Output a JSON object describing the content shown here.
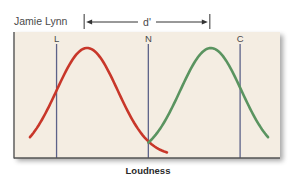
{
  "chart_data": {
    "type": "line",
    "title": "Jamie Lynn",
    "xlabel": "Loudness",
    "ylabel": "",
    "annotation": "d'",
    "xlim": [
      0,
      10
    ],
    "ylim": [
      0,
      1
    ],
    "grid": false,
    "series": [
      {
        "name": "noise",
        "color": "#c8372a",
        "mean": 2.75,
        "sd": 1.15,
        "x_range": [
          0.6,
          5.75
        ]
      },
      {
        "name": "signal",
        "color": "#5a9460",
        "mean": 7.4,
        "sd": 1.15,
        "x_range": [
          5.05,
          9.55
        ]
      }
    ],
    "criteria": [
      {
        "label": "L",
        "x": 1.6
      },
      {
        "label": "N",
        "x": 5.05
      },
      {
        "label": "C",
        "x": 8.5
      }
    ],
    "dprime": {
      "from": 2.75,
      "to": 7.4
    }
  },
  "colors": {
    "background": "#f4ede2",
    "criterion_line": "#5c6288",
    "axis": "#555555"
  }
}
